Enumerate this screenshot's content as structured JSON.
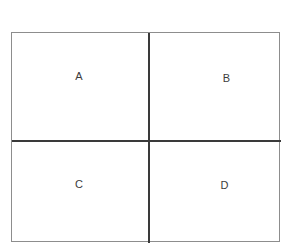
{
  "diagram": {
    "background_color": "#ffffff",
    "outer_border_color": "#8d8d8d",
    "divider_color": "#3a3a3a",
    "label_color": "#3c3c3c",
    "rows": 2,
    "columns": 2,
    "cells": [
      {
        "id": "a",
        "label": "A",
        "row": 1,
        "column": 1,
        "position": "top-left"
      },
      {
        "id": "b",
        "label": "B",
        "row": 1,
        "column": 2,
        "position": "top-right"
      },
      {
        "id": "c",
        "label": "C",
        "row": 2,
        "column": 1,
        "position": "bottom-left"
      },
      {
        "id": "d",
        "label": "D",
        "row": 2,
        "column": 2,
        "position": "bottom-right"
      }
    ]
  }
}
